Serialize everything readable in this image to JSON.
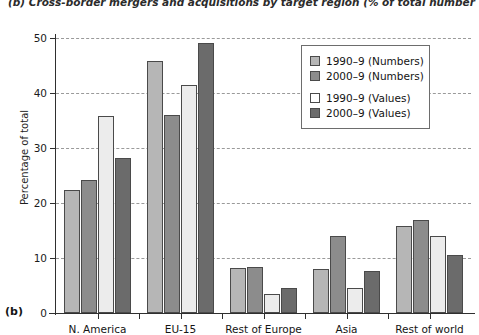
{
  "figure": {
    "panel_letter": "(b)",
    "caption": "(b) Cross-border mergers and acquisitions by target region (% of total number and value)"
  },
  "chart_data": {
    "type": "bar",
    "title": "(b) Cross-border mergers and acquisitions by target region (% of total number and value)",
    "xlabel": "",
    "ylabel": "Percentage of total",
    "ylim": [
      0,
      50
    ],
    "yticks": [
      0,
      10,
      20,
      30,
      40,
      50
    ],
    "ytick_labels": [
      "0",
      "10",
      "20",
      "30",
      "40",
      "50"
    ],
    "grid": true,
    "legend_position": "upper right",
    "categories": [
      "N. America",
      "EU-15",
      "Rest of Europe",
      "Asia",
      "Rest of world"
    ],
    "series": [
      {
        "name": "1990–9 (Numbers)",
        "color": "#b6b6b6",
        "values": [
          22.4,
          45.8,
          8.2,
          8.0,
          15.8
        ]
      },
      {
        "name": "2000–9 (Numbers)",
        "color": "#8c8c8c",
        "values": [
          24.2,
          36.0,
          8.4,
          14.0,
          17.0
        ]
      },
      {
        "name": "1990–9 (Values)",
        "color": "#ececec",
        "values": [
          35.8,
          41.5,
          3.5,
          4.6,
          14.0
        ]
      },
      {
        "name": "2000–9 (Values)",
        "color": "#6b6b6b",
        "values": [
          28.2,
          49.1,
          4.6,
          7.6,
          10.6
        ]
      }
    ]
  },
  "legend": {
    "items": [
      {
        "label": "1990–9 (Numbers)"
      },
      {
        "label": "2000–9 (Numbers)"
      },
      {
        "label": "1990–9 (Values)"
      },
      {
        "label": "2000–9 (Values)"
      }
    ]
  }
}
